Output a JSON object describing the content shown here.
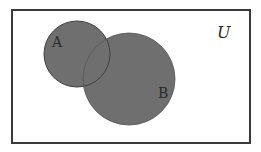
{
  "diagram": {
    "type": "venn",
    "universe_label": "U",
    "sets": [
      {
        "label": "A",
        "cx": 77,
        "cy": 54,
        "r": 33
      },
      {
        "label": "B",
        "cx": 129,
        "cy": 79,
        "r": 46
      }
    ],
    "colors": {
      "fill": "#6f6f6f",
      "border": "#4a4a4a",
      "frame": "#3a3a3a",
      "background": "#ffffff"
    },
    "shaded_region": "A ∪ B"
  }
}
